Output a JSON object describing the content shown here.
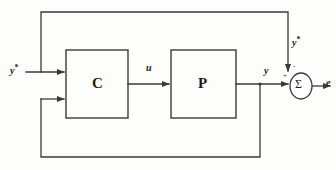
{
  "diagram": {
    "type": "control-block-diagram",
    "background_color": "#fdfdfc",
    "line_color": "#3a3a3a",
    "text_color": "#1c1c1c",
    "blocks": [
      {
        "id": "controller",
        "label": "C",
        "name": "controller-block",
        "x": 66,
        "y": 50,
        "w": 62,
        "h": 68
      },
      {
        "id": "plant",
        "label": "P",
        "name": "plant-block",
        "x": 171,
        "y": 50,
        "w": 65,
        "h": 68
      }
    ],
    "summing_junction": {
      "label": "Σ",
      "name": "summing-junction",
      "cx": 301,
      "cy": 86,
      "rx": 11,
      "ry": 13,
      "sign_top": "-",
      "sign_left": "+"
    },
    "signals": {
      "reference_input": {
        "base": "y",
        "sup": "*"
      },
      "reference_top": {
        "base": "y",
        "sup": "*"
      },
      "control": {
        "base": "u",
        "sup": ""
      },
      "output": {
        "base": "y",
        "sup": ""
      },
      "error": {
        "base": "e",
        "sup": ""
      }
    },
    "edges": [
      {
        "name": "reference-to-controller",
        "from": "y*",
        "to": "C (upper input)"
      },
      {
        "name": "reference-to-sum",
        "from": "y*",
        "to": "Σ (top input)"
      },
      {
        "name": "controller-to-plant",
        "from": "C",
        "to": "P",
        "label": "u"
      },
      {
        "name": "plant-to-sum",
        "from": "P",
        "to": "Σ (left input)",
        "label": "y"
      },
      {
        "name": "output-feedback-to-controller",
        "from": "y",
        "to": "C (lower input)"
      },
      {
        "name": "sum-to-error",
        "from": "Σ",
        "to": "e"
      }
    ]
  }
}
